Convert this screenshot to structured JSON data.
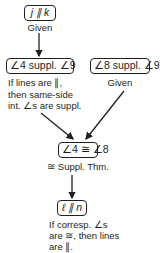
{
  "diagram": {
    "type": "flow-proof",
    "nodes": [
      {
        "id": "n1",
        "statement": "j ∥ k",
        "reason": "Given"
      },
      {
        "id": "n2",
        "statement": "∠4 suppl. ∠9",
        "reason_lines": [
          "If lines are ∥,",
          "then same-side",
          "int. ∠s are suppl."
        ]
      },
      {
        "id": "n3",
        "statement": "∠8 suppl. ∠9",
        "reason": "Given"
      },
      {
        "id": "n4",
        "statement": "∠4 ≅ ∠8",
        "reason": "≅ Suppl. Thm."
      },
      {
        "id": "n5",
        "statement": "ℓ ∥ n",
        "reason_lines": [
          "If corresp. ∠s",
          "are ≅, then lines",
          "are ∥."
        ]
      }
    ],
    "edges": [
      {
        "from": "n1",
        "to": "n2"
      },
      {
        "from": "n2",
        "to": "n4"
      },
      {
        "from": "n3",
        "to": "n4"
      },
      {
        "from": "n4",
        "to": "n5"
      }
    ]
  }
}
